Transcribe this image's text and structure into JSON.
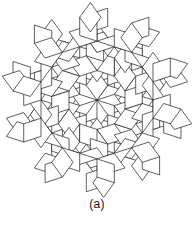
{
  "figure": {
    "caption": "(a)",
    "kind": "rhombic-penrose-tiling",
    "symmetry": "10-fold",
    "stroke_color": "#1a1a1a",
    "fill_color": "#ffffff",
    "background_color": "#ffffff",
    "stroke_width": 0.9,
    "center": {
      "x": 97,
      "y": 100
    },
    "edge_length": 23.5,
    "rotation_deg": 0,
    "rhombi": {
      "fat_angle_deg": 72,
      "thin_angle_deg": 36
    },
    "rings": [
      {
        "name": "core-fat-ring",
        "type": "fat",
        "count": 10,
        "radius": 0,
        "note": "ten fat rhombi sharing the central vertex (sun)"
      },
      {
        "name": "ring1-thin",
        "type": "thin",
        "count": 10,
        "note": "thin rhombi bridging the core fat rhombi"
      },
      {
        "name": "ring2-fat",
        "type": "fat",
        "count": 10,
        "note": "fat rhombi forming the second decagonal band"
      },
      {
        "name": "ring2-thin",
        "type": "thin",
        "count": 10,
        "note": "thin rhombi wedged between second-band fat rhombi"
      },
      {
        "name": "ring3-fat",
        "type": "fat",
        "count": 20,
        "note": "outer fat rhombi forming the broad decagonal rim"
      },
      {
        "name": "ring3-thin-points",
        "type": "thin",
        "count": 10,
        "note": "thin rhombi protruding as points around the rim"
      }
    ]
  }
}
